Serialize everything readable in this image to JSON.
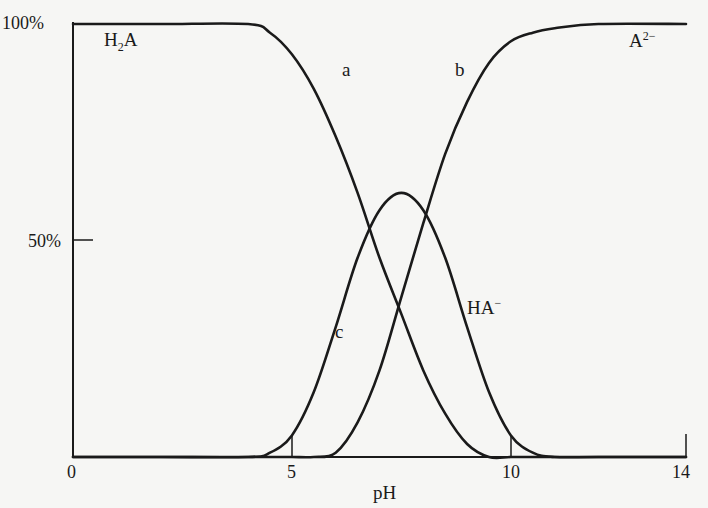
{
  "chart_data": {
    "type": "line",
    "title": "",
    "xlabel": "pH",
    "ylabel": "",
    "xlim": [
      0,
      14
    ],
    "ylim": [
      0,
      100
    ],
    "grid": false,
    "x_ticks": [
      {
        "value": 0,
        "label": "0"
      },
      {
        "value": 5,
        "label": "5"
      },
      {
        "value": 10,
        "label": "10"
      },
      {
        "value": 14,
        "label": "14"
      }
    ],
    "y_ticks": [
      {
        "value": 50,
        "label": "50%"
      },
      {
        "value": 100,
        "label": "100%"
      }
    ],
    "x": [
      0,
      2,
      4,
      4.5,
      5,
      5.5,
      6,
      6.5,
      7,
      7.5,
      8,
      8.5,
      9,
      9.5,
      10,
      10.5,
      11,
      12,
      14
    ],
    "series": [
      {
        "name": "a (H2A)",
        "curve_label": "a",
        "values": [
          100,
          100,
          100,
          98,
          93,
          85,
          74,
          61,
          46,
          33,
          20,
          10,
          3,
          0,
          0,
          0,
          0,
          0,
          0
        ]
      },
      {
        "name": "b (A2-)",
        "curve_label": "b",
        "values": [
          0,
          0,
          0,
          0,
          0,
          0,
          1,
          8,
          20,
          37,
          54,
          70,
          82,
          91,
          96,
          98,
          99,
          100,
          100
        ]
      },
      {
        "name": "c (HA-)",
        "curve_label": "c",
        "values": [
          0,
          0,
          0,
          1,
          5,
          15,
          30,
          46,
          57,
          61,
          57,
          46,
          30,
          15,
          5,
          1,
          0,
          0,
          0
        ]
      }
    ],
    "annotations": [
      {
        "text": "H2A",
        "display": "H",
        "sub": "2",
        "tail": "A",
        "x": 1.0,
        "y": 96
      },
      {
        "text": "A2-",
        "display": "A",
        "sup": "2−",
        "x": 12.9,
        "y": 96
      },
      {
        "text": "HA-",
        "display": "HA",
        "sup": "−",
        "x": 9.1,
        "y": 34
      },
      {
        "text": "a",
        "x": 6.3,
        "y": 85
      },
      {
        "text": "b",
        "x": 8.6,
        "y": 85
      },
      {
        "text": "c",
        "x": 6.1,
        "y": 27
      }
    ]
  },
  "labels": {
    "y100": "100%",
    "y50": "50%",
    "x0": "0",
    "x5": "5",
    "x10": "10",
    "x14": "14",
    "xlabel": "pH",
    "h2a_main": "H",
    "h2a_sub": "2",
    "h2a_tail": "A",
    "a2_main": "A",
    "a2_sup": "2−",
    "ha_main": "HA",
    "ha_sup": "−",
    "curve_a": "a",
    "curve_b": "b",
    "curve_c": "c"
  }
}
